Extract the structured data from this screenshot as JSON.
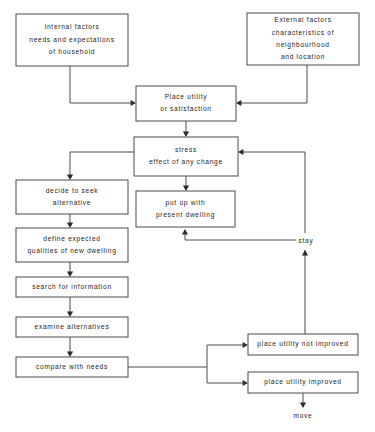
{
  "diagram": {
    "stroke_color": "#4a4a4a",
    "text_color": "#1d1d1d",
    "background": "#ffffff",
    "nodes": [
      {
        "id": "internal-factors",
        "lines": [
          "Internal factors",
          "needs and expectations",
          "of household"
        ],
        "x": 16,
        "y": 14,
        "w": 112,
        "h": 52
      },
      {
        "id": "external-factors",
        "lines": [
          "External factors",
          "characteristics of",
          "neighbourhood",
          "and  location"
        ],
        "x": 247,
        "y": 13,
        "w": 112,
        "h": 52
      },
      {
        "id": "place-utility",
        "lines": [
          "Place utility",
          "or satisfaction"
        ],
        "x": 136,
        "y": 86,
        "w": 100,
        "h": 35
      },
      {
        "id": "stress",
        "lines": [
          "stress",
          "effect of any change"
        ],
        "x": 134,
        "y": 137,
        "w": 104,
        "h": 39
      },
      {
        "id": "decide-to-seek",
        "lines": [
          "decide to seek",
          "alternative"
        ],
        "x": 16,
        "y": 180,
        "w": 112,
        "h": 34
      },
      {
        "id": "put-up-with",
        "lines": [
          "put up with",
          "present dwelling"
        ],
        "x": 136,
        "y": 191,
        "w": 99,
        "h": 36
      },
      {
        "id": "define-expected",
        "lines": [
          "define expected",
          "qualities of new dwelling"
        ],
        "x": 16,
        "y": 228,
        "w": 112,
        "h": 34
      },
      {
        "id": "search-for-information",
        "lines": [
          "search for  information"
        ],
        "x": 16,
        "y": 277,
        "w": 112,
        "h": 20
      },
      {
        "id": "examine-alternatives",
        "lines": [
          "examine alternatives"
        ],
        "x": 16,
        "y": 317,
        "w": 112,
        "h": 20
      },
      {
        "id": "compare-with-needs",
        "lines": [
          "compare with needs"
        ],
        "x": 16,
        "y": 357,
        "w": 112,
        "h": 20
      },
      {
        "id": "place-utility-not-improved",
        "lines": [
          "place utility not improved"
        ],
        "x": 248,
        "y": 334,
        "w": 110,
        "h": 21
      },
      {
        "id": "place-utility-improved",
        "lines": [
          "place utility  improved"
        ],
        "x": 248,
        "y": 372,
        "w": 110,
        "h": 21
      }
    ],
    "edge_labels": [
      {
        "id": "stay-label",
        "text": "stay",
        "x": 306,
        "y": 241
      },
      {
        "id": "move-label",
        "text": "move",
        "x": 303,
        "y": 416
      }
    ],
    "edges": [
      {
        "id": "internal-to-place-utility",
        "d": "M 70 66 L 70 103 L 131 103"
      },
      {
        "id": "external-to-place-utility",
        "d": "M 307 65 L 307 103 L 241 103"
      },
      {
        "id": "place-utility-to-stress",
        "d": "M 186 121 L 186 132"
      },
      {
        "id": "stress-to-decide",
        "d": "M 134 152 L 70 152 L 70 175"
      },
      {
        "id": "stress-to-put-up-with",
        "d": "M 186 176 L 186 186"
      },
      {
        "id": "decide-to-define",
        "d": "M 70 214 L 70 223"
      },
      {
        "id": "define-to-search",
        "d": "M 70 262 L 70 272"
      },
      {
        "id": "search-to-examine",
        "d": "M 70 297 L 70 312"
      },
      {
        "id": "examine-to-compare",
        "d": "M 70 337 L 70 352"
      },
      {
        "id": "compare-to-split",
        "d": "M 128 367 L 207 367"
      },
      {
        "id": "split-to-not-improved",
        "d": "M 207 367 L 207 345 L 243 345"
      },
      {
        "id": "split-to-improved",
        "d": "M 207 367 L 207 383 L 243 383"
      },
      {
        "id": "not-improved-to-stay",
        "d": "M 305 334 L 305 250"
      },
      {
        "id": "stay-to-stress",
        "d": "M 305 233 L 305 152 L 243 152"
      },
      {
        "id": "improved-to-move",
        "d": "M 303 393 L 303 406"
      },
      {
        "id": "stay-branch-to-put-up-with",
        "d": "M 296 240 L 185 240 L 185 232"
      }
    ],
    "arrowheads": [
      {
        "id": "arrow-into-place-utility-left",
        "x": 136,
        "y": 103,
        "dir": "right"
      },
      {
        "id": "arrow-into-place-utility-right",
        "x": 236,
        "y": 103,
        "dir": "left"
      },
      {
        "id": "arrow-into-stress-top",
        "x": 186,
        "y": 137,
        "dir": "down"
      },
      {
        "id": "arrow-into-decide-top",
        "x": 70,
        "y": 180,
        "dir": "down"
      },
      {
        "id": "arrow-into-put-up-with-top",
        "x": 186,
        "y": 191,
        "dir": "down"
      },
      {
        "id": "arrow-into-define-top",
        "x": 70,
        "y": 228,
        "dir": "down"
      },
      {
        "id": "arrow-into-search-top",
        "x": 70,
        "y": 277,
        "dir": "down"
      },
      {
        "id": "arrow-into-examine-top",
        "x": 70,
        "y": 317,
        "dir": "down"
      },
      {
        "id": "arrow-into-compare-top",
        "x": 70,
        "y": 357,
        "dir": "down"
      },
      {
        "id": "arrow-into-not-improved-left",
        "x": 248,
        "y": 345,
        "dir": "right"
      },
      {
        "id": "arrow-into-improved-left",
        "x": 248,
        "y": 383,
        "dir": "right"
      },
      {
        "id": "arrow-into-stay-up",
        "x": 305,
        "y": 250,
        "dir": "up"
      },
      {
        "id": "arrow-into-stress-right",
        "x": 238,
        "y": 152,
        "dir": "left"
      },
      {
        "id": "arrow-into-move-down",
        "x": 303,
        "y": 408,
        "dir": "down"
      },
      {
        "id": "arrow-into-put-up-with-bottom",
        "x": 185,
        "y": 229,
        "dir": "up"
      }
    ]
  }
}
